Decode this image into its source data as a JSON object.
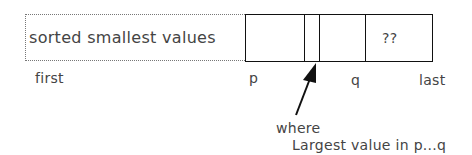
{
  "diagram": {
    "sorted_region_label": "sorted smallest values",
    "unknown_cell_label": "??",
    "index_labels": {
      "first": "first",
      "p": "p",
      "q": "q",
      "last": "last"
    },
    "arrow_labels": {
      "where": "where",
      "description": "Largest value in p...q"
    }
  }
}
